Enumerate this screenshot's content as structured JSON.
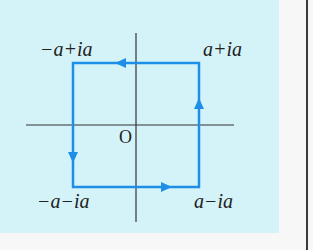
{
  "diagram": {
    "labels": {
      "top_left": "−a+ia",
      "top_right": "a+ia",
      "bottom_left": "−a−ia",
      "bottom_right": "a−ia",
      "origin": "O"
    },
    "colors": {
      "background": "#d4f3f9",
      "contour": "#1e8fe6",
      "axes": "#333333"
    },
    "direction": "counterclockwise"
  }
}
